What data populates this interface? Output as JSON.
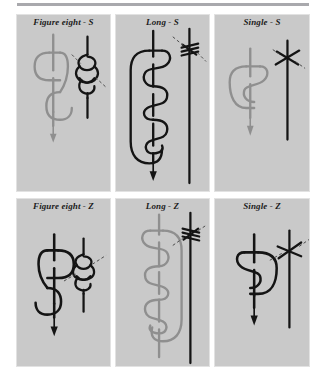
{
  "figure": {
    "background_color": "#ffffff",
    "panel_fill_color": "#c9c9c9",
    "panel_border_color": "#e2e2e2",
    "rule_color": "#a9a9ad",
    "stroke_dark_color": "#141414",
    "stroke_light_color": "#8f8f8f",
    "leader_line_color": "#4a4a4a"
  },
  "panels": [
    {
      "id": "figure-eight-s",
      "title": "Figure eight - S",
      "row": 0,
      "column": 0,
      "left_figure_color": "#8f8f8f",
      "right_figure_color": "#141414",
      "knot_type": "figure eight",
      "chirality": "S"
    },
    {
      "id": "long-s",
      "title": "Long - S",
      "row": 0,
      "column": 1,
      "left_figure_color": "#141414",
      "right_figure_color": "#141414",
      "knot_type": "long",
      "chirality": "S"
    },
    {
      "id": "single-s",
      "title": "Single - S",
      "row": 0,
      "column": 2,
      "left_figure_color": "#8f8f8f",
      "right_figure_color": "#141414",
      "knot_type": "single",
      "chirality": "S"
    },
    {
      "id": "figure-eight-z",
      "title": "Figure eight - Z",
      "row": 1,
      "column": 0,
      "left_figure_color": "#141414",
      "right_figure_color": "#141414",
      "knot_type": "figure eight",
      "chirality": "Z"
    },
    {
      "id": "long-z",
      "title": "Long - Z",
      "row": 1,
      "column": 1,
      "left_figure_color": "#8f8f8f",
      "right_figure_color": "#141414",
      "knot_type": "long",
      "chirality": "Z"
    },
    {
      "id": "single-z",
      "title": "Single - Z",
      "row": 1,
      "column": 2,
      "left_figure_color": "#141414",
      "right_figure_color": "#141414",
      "knot_type": "single",
      "chirality": "Z"
    }
  ]
}
